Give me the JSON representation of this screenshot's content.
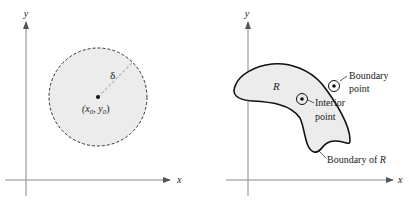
{
  "left_panel": {
    "y_axis_label": "y",
    "x_axis_label": "x",
    "radius_label": "δ",
    "center_label_open": "(x",
    "center_sub0": "0",
    "center_comma": ", y",
    "center_sub1": "0",
    "center_label_close": ")",
    "caption_partial": "...",
    "colors": {
      "disk_fill": "#ececec",
      "dash_stroke": "#333333",
      "radius_stroke": "#bdbdbd"
    }
  },
  "right_panel": {
    "y_axis_label": "y",
    "x_axis_label": "x",
    "region_label": "R",
    "boundary_point_label": [
      "Boundary",
      "point"
    ],
    "interior_point_label": [
      "Interior",
      "point"
    ],
    "boundary_of_r_label": "Boundary of",
    "boundary_of_r_italic": "R",
    "colors": {
      "region_fill": "#ececec",
      "outline": "#111111"
    }
  }
}
